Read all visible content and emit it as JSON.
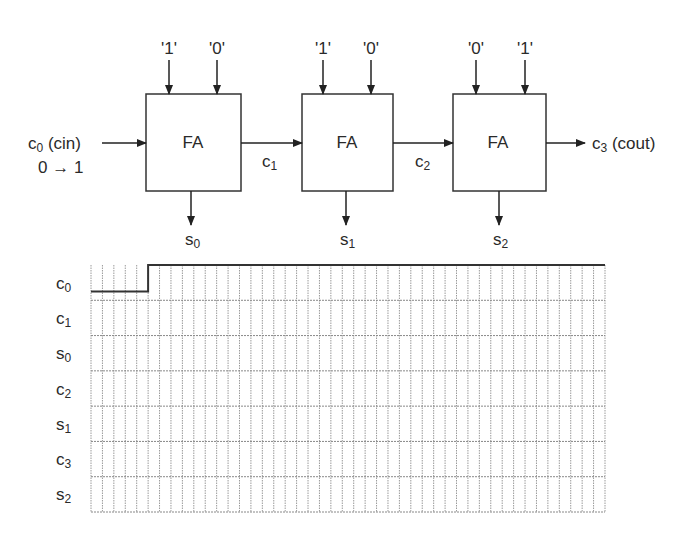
{
  "diagram": {
    "cin_label": "c0 (cin)",
    "cin_transition": "0 → 1",
    "cout_label": "c3 (cout)",
    "blocks": [
      {
        "label": "FA",
        "inputs": [
          "'1'",
          "'0'"
        ],
        "sum": "s0",
        "carry_out": "c1"
      },
      {
        "label": "FA",
        "inputs": [
          "'1'",
          "'0'"
        ],
        "sum": "s1",
        "carry_out": "c2"
      },
      {
        "label": "FA",
        "inputs": [
          "'0'",
          "'1'"
        ],
        "sum": "s2",
        "carry_out": "c3"
      }
    ]
  },
  "timing": {
    "signals": [
      "c0",
      "c1",
      "s0",
      "c2",
      "s1",
      "c3",
      "s2"
    ],
    "grid_columns": 45,
    "c0_transition_column": 5,
    "note": "Only c0 waveform drawn (low then high); other signals blank to be filled"
  }
}
